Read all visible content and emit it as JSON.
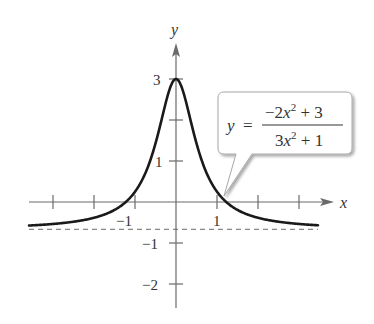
{
  "chart_data": {
    "type": "line",
    "title": "",
    "xlabel": "x",
    "ylabel": "y",
    "function": "y = (-2x^2 + 3) / (3x^2 + 1)",
    "xlim": [
      -3.6,
      3.8
    ],
    "ylim": [
      -2.6,
      3.9
    ],
    "x_ticks": [
      -3,
      -2,
      -1,
      1,
      2,
      3
    ],
    "x_tick_labels": [
      "-1",
      "1"
    ],
    "y_ticks": [
      -2,
      -1,
      1,
      2,
      3
    ],
    "y_tick_labels": [
      "-2",
      "-1",
      "1",
      "3"
    ],
    "grid": false,
    "asymptote": {
      "type": "horizontal",
      "y": -0.6667,
      "style": "dashed"
    },
    "series": [
      {
        "name": "y = (-2x^2+3)/(3x^2+1)",
        "x": [
          -3.5,
          -3,
          -2.5,
          -2,
          -1.5,
          -1,
          -0.75,
          -0.5,
          -0.25,
          0,
          0.25,
          0.5,
          0.75,
          1,
          1.5,
          2,
          2.5,
          3,
          3.5
        ],
        "values": [
          -0.57,
          -0.54,
          -0.49,
          -0.38,
          -0.11,
          0.25,
          0.72,
          1.43,
          2.31,
          3,
          2.31,
          1.43,
          0.72,
          0.25,
          -0.11,
          -0.38,
          -0.49,
          -0.54,
          -0.57
        ]
      }
    ],
    "annotations": [
      {
        "text": "y = (-2x^2 + 3) / (3x^2 + 1)",
        "points_to": [
          1.15,
          0.07
        ]
      }
    ]
  },
  "labels": {
    "x_axis": "x",
    "y_axis": "y",
    "x_tick_neg1": "−1",
    "x_tick_1": "1",
    "y_tick_3": "3",
    "y_tick_1": "1",
    "y_tick_neg1": "−1",
    "y_tick_neg2": "−2"
  },
  "callout": {
    "lhs": "y",
    "equals": "=",
    "numerator_a": "−2",
    "numerator_var": "x",
    "numerator_exp": "2",
    "numerator_b": " + 3",
    "denominator_a": "3",
    "denominator_var": "x",
    "denominator_exp": "2",
    "denominator_b": " + 1"
  },
  "colors": {
    "axis": "#666666",
    "curve": "#1a1a1a",
    "asymptote": "#777777",
    "callout_border": "#aaaaaa"
  }
}
